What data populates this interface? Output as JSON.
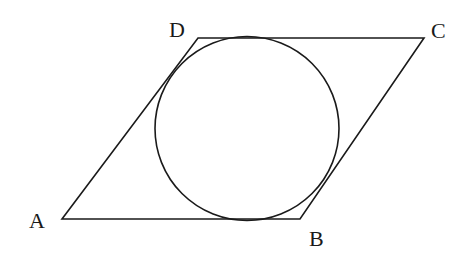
{
  "diagram": {
    "type": "geometry",
    "colors": {
      "stroke": "#1a1a1a",
      "background": "#ffffff"
    },
    "vertices": [
      {
        "id": "A",
        "label": "A",
        "x": 62,
        "y": 219,
        "label_x": 29,
        "label_y": 228
      },
      {
        "id": "B",
        "label": "B",
        "x": 300,
        "y": 219,
        "label_x": 309,
        "label_y": 246
      },
      {
        "id": "C",
        "label": "C",
        "x": 424,
        "y": 38,
        "label_x": 431,
        "label_y": 38
      },
      {
        "id": "D",
        "label": "D",
        "x": 198,
        "y": 38,
        "label_x": 169,
        "label_y": 37
      }
    ],
    "edges": [
      {
        "from": "A",
        "to": "B"
      },
      {
        "from": "B",
        "to": "C"
      },
      {
        "from": "C",
        "to": "D"
      },
      {
        "from": "D",
        "to": "A"
      }
    ],
    "circle": {
      "cx": 247,
      "cy": 128.5,
      "r": 92,
      "tangent_to": [
        "AB",
        "BC",
        "CD",
        "DA"
      ]
    }
  }
}
